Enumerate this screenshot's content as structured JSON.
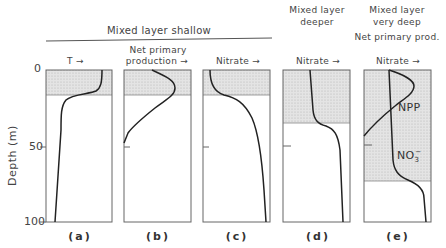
{
  "figure": {
    "group_header": "Mixed layer shallow",
    "y_axis": {
      "label": "Depth (m)",
      "ticks": [
        "0",
        "50",
        "100"
      ]
    },
    "panels": [
      {
        "id": "a",
        "letter": "(a)",
        "var_label": "T",
        "arrow": "→",
        "mixed_layer_depth_m": 16
      },
      {
        "id": "b",
        "letter": "(b)",
        "var_label_line1": "Net primary",
        "var_label_line2": "production",
        "arrow": "→",
        "mixed_layer_depth_m": 16
      },
      {
        "id": "c",
        "letter": "(c)",
        "var_label": "Nitrate",
        "arrow": "→",
        "mixed_layer_depth_m": 16
      },
      {
        "id": "d",
        "letter": "(d)",
        "header_line1": "Mixed layer",
        "header_line2": "deeper",
        "var_label": "Nitrate",
        "arrow": "→",
        "mixed_layer_depth_m": 35
      },
      {
        "id": "e",
        "letter": "(e)",
        "header_line1": "Mixed layer",
        "header_line2": "very deep",
        "header_line3": "Net primary prod.",
        "var_label": "Nitrate",
        "arrow": "→",
        "mixed_layer_depth_m": 73,
        "curve_labels": [
          "NPP",
          "NO",
          "3",
          "−"
        ]
      }
    ]
  },
  "colors": {
    "stroke": "#222222",
    "shade": "#d9d9d9",
    "frame": "#666666"
  }
}
